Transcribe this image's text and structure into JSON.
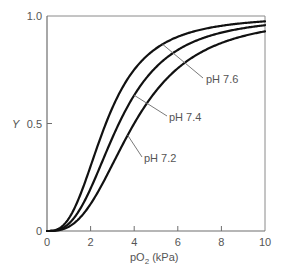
{
  "chart_data": {
    "type": "line",
    "title": "",
    "xlabel": "pO",
    "xlabel_sub": "2",
    "xlabel_unit": " (kPa)",
    "ylabel": "Y",
    "xlim": [
      0,
      10
    ],
    "ylim": [
      0,
      1.0
    ],
    "grid": false,
    "x_ticks": [
      0,
      2,
      4,
      6,
      8,
      10
    ],
    "x_tick_labels": [
      "0",
      "2",
      "4",
      "6",
      "8",
      "10"
    ],
    "y_ticks": [
      0,
      0.5,
      1.0
    ],
    "y_tick_labels": [
      "0",
      "0.5",
      "1.0"
    ],
    "model": "hill",
    "series": [
      {
        "name": "pH 7.6",
        "label": "pH 7.6",
        "p50": 2.7,
        "hill_n": 2.8,
        "x": [
          0,
          1,
          2,
          2.7,
          3,
          4,
          5,
          6,
          7,
          8,
          9,
          10
        ],
        "values": [
          0,
          0.06,
          0.3,
          0.5,
          0.57,
          0.75,
          0.86,
          0.9,
          0.93,
          0.95,
          0.97,
          0.975
        ],
        "label_anchor_x": 5.3
      },
      {
        "name": "pH 7.4",
        "label": "pH 7.4",
        "p50": 3.3,
        "hill_n": 2.8,
        "x": [
          0,
          1,
          2,
          3,
          3.3,
          4,
          5,
          6,
          7,
          8,
          9,
          10
        ],
        "values": [
          0,
          0.035,
          0.2,
          0.43,
          0.5,
          0.63,
          0.76,
          0.84,
          0.89,
          0.92,
          0.94,
          0.955
        ],
        "label_anchor_x": 4.0
      },
      {
        "name": "pH 7.2",
        "label": "pH 7.2",
        "p50": 4.0,
        "hill_n": 2.8,
        "x": [
          0,
          1,
          2,
          3,
          4,
          5,
          6,
          7,
          8,
          9,
          10
        ],
        "values": [
          0,
          0.02,
          0.13,
          0.31,
          0.5,
          0.65,
          0.76,
          0.83,
          0.88,
          0.91,
          0.93
        ],
        "label_anchor_x": 3.7
      }
    ]
  }
}
